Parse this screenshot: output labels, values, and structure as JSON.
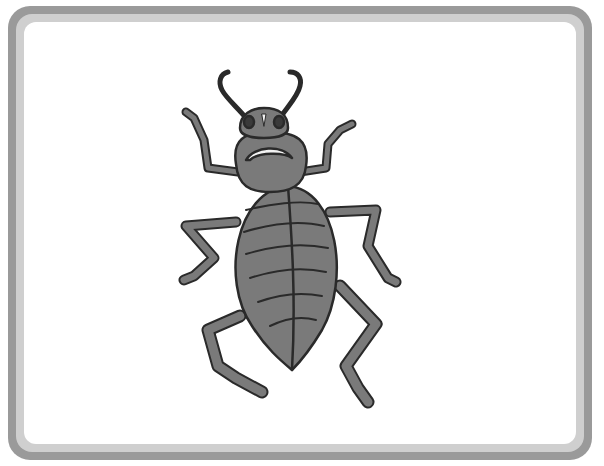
{
  "image": {
    "subject": "beetle illustration",
    "frame": {
      "outer_color": "#9a9a9a",
      "inner_color": "#cfcfcf",
      "background": "#ffffff"
    },
    "colors": {
      "body_fill": "#7a7a7a",
      "outline": "#2a2a2a",
      "highlight": "#f2f2f2",
      "eye": "#3a3a3a"
    },
    "icon": "beetle-icon"
  }
}
